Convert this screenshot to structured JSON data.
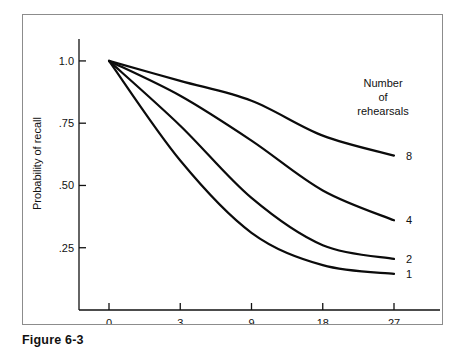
{
  "figure": {
    "caption": "Figure 6-3"
  },
  "chart_data": {
    "type": "line",
    "title": "",
    "xlabel": "Retention interval (s)",
    "ylabel": "Probability of recall",
    "grid": false,
    "legend_position": "right-inside-top",
    "legend_title_lines": [
      "Number",
      "of",
      "rehearsals"
    ],
    "x_tick_labels": [
      "0",
      "3",
      "9",
      "18",
      "27"
    ],
    "x_tick_values": [
      0,
      3,
      9,
      18,
      27
    ],
    "y_tick_labels": [
      "1.0",
      ".75",
      ".50",
      ".25"
    ],
    "y_tick_values": [
      1.0,
      0.75,
      0.5,
      0.25
    ],
    "ylim": [
      0,
      1.08
    ],
    "x_axis_scale": "ordinal-compressed",
    "series": [
      {
        "name": "8",
        "label": "8",
        "values": [
          1.0,
          0.92,
          0.84,
          0.7,
          0.62
        ]
      },
      {
        "name": "4",
        "label": "4",
        "values": [
          1.0,
          0.86,
          0.68,
          0.48,
          0.36
        ]
      },
      {
        "name": "2",
        "label": "2",
        "values": [
          1.0,
          0.74,
          0.45,
          0.26,
          0.205
        ]
      },
      {
        "name": "1",
        "label": "1",
        "values": [
          1.0,
          0.6,
          0.31,
          0.18,
          0.145
        ]
      }
    ]
  }
}
